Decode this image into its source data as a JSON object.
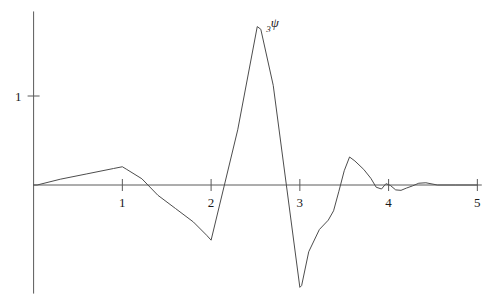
{
  "chart_data": {
    "type": "line",
    "title": "",
    "subtitle": "",
    "xlabel": "",
    "ylabel": "",
    "xlim": [
      -0.05,
      5.1
    ],
    "ylim": [
      -1.25,
      2.0
    ],
    "grid": false,
    "legend_position": "none",
    "annotations": [
      {
        "name": "curve-label",
        "text_sub": "3",
        "text_main": "ψ",
        "x": 2.62,
        "y": 1.78
      }
    ],
    "axes": {
      "x_axis": {
        "y_value": 0,
        "x_start": 0,
        "x_end": 5.05
      },
      "y_axis": {
        "x_value": 0,
        "y_start": -1.22,
        "y_end": 1.95
      },
      "x_ticks": [
        1,
        2,
        3,
        4,
        5
      ],
      "x_tick_labels": [
        "1",
        "2",
        "3",
        "4",
        "5"
      ],
      "y_ticks": [
        1
      ],
      "y_tick_labels": [
        "1"
      ]
    },
    "series": [
      {
        "name": "daubechies-3-wavelet",
        "color": "#4d4d4d",
        "x": [
          0.0,
          0.04,
          0.3,
          0.6,
          0.9,
          1.0,
          1.05,
          1.22,
          1.4,
          1.6,
          1.8,
          1.95,
          2.0,
          2.3,
          2.52,
          2.56,
          2.7,
          3.0,
          3.02,
          3.1,
          3.22,
          3.32,
          3.38,
          3.44,
          3.5,
          3.56,
          3.62,
          3.72,
          3.8,
          3.86,
          3.92,
          3.97,
          4.02,
          4.08,
          4.14,
          4.2,
          4.27,
          4.34,
          4.42,
          4.55,
          4.75,
          5.0
        ],
        "y": [
          0.0,
          0.0,
          0.065,
          0.125,
          0.185,
          0.205,
          0.175,
          0.07,
          -0.115,
          -0.265,
          -0.415,
          -0.565,
          -0.62,
          0.62,
          1.78,
          1.75,
          1.12,
          -1.15,
          -1.13,
          -0.75,
          -0.5,
          -0.395,
          -0.29,
          -0.07,
          0.16,
          0.315,
          0.27,
          0.175,
          0.075,
          -0.025,
          -0.045,
          0.015,
          -0.005,
          -0.055,
          -0.06,
          -0.035,
          -0.01,
          0.02,
          0.025,
          0.0,
          0.0,
          0.0
        ]
      }
    ]
  },
  "figure": {
    "background_color": "#ffffff",
    "axis_color": "#5a5a5a",
    "curve_color": "#4d4d4d",
    "text_color": "#1a1a1a"
  }
}
